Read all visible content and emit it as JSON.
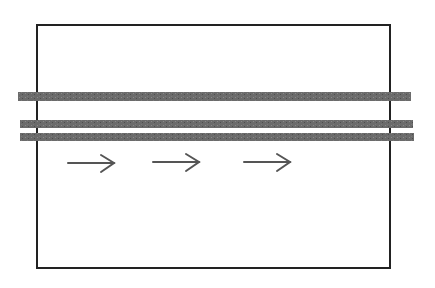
{
  "diagram": {
    "background": "#ffffff",
    "frame": {
      "x": 37,
      "y": 25,
      "width": 353,
      "height": 243,
      "stroke": "#222222",
      "stroke_width": 2
    },
    "bands": [
      {
        "x": 18,
        "y": 92,
        "width": 393,
        "height": 9,
        "fill": "#666666"
      },
      {
        "x": 20,
        "y": 120,
        "width": 393,
        "height": 8,
        "fill": "#666666"
      },
      {
        "x": 20,
        "y": 133,
        "width": 394,
        "height": 8,
        "fill": "#666666"
      }
    ],
    "arrows": [
      {
        "x1": 68,
        "x2": 114,
        "y": 163,
        "color": "#555555"
      },
      {
        "x1": 153,
        "x2": 199,
        "y": 162,
        "color": "#555555"
      },
      {
        "x1": 244,
        "x2": 290,
        "y": 162,
        "color": "#555555"
      }
    ],
    "arrow_direction": "right",
    "band_texture": "dotted-stipple"
  }
}
